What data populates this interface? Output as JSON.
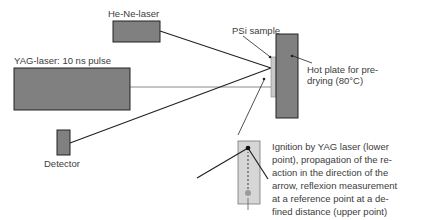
{
  "labels": {
    "he_ne_laser": "He-Ne-laser",
    "yag_laser": "YAG-laser: 10 ns pulse",
    "psi_sample": "PSi sample",
    "hot_plate": "Hot plate for pre-",
    "hot_plate_2": "drying (80°C)",
    "detector": "Detector",
    "description": [
      "Ignition by YAG laser (lower",
      "point), propagation of the re-",
      "action in the direction of the",
      "arrow, reflexion measurement",
      "at a reference point at a de-",
      "fined distance (upper point)"
    ]
  },
  "colors": {
    "component_fill": "#808080",
    "sample_fill": "#c8c8c8",
    "inset_fill": "#d6d6d6",
    "line": "#222222",
    "beam_gray": "#8a8a8a",
    "text": "#3c3c3c"
  }
}
